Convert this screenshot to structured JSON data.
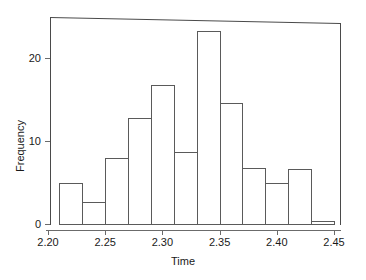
{
  "chart_data": {
    "type": "bar",
    "subtype": "histogram",
    "title": "",
    "xlabel": "Time",
    "ylabel": "Frequency",
    "xlim": [
      2.205,
      2.455
    ],
    "ylim": [
      0,
      24.5
    ],
    "xticks": [
      "2.20",
      "2.25",
      "2.30",
      "2.35",
      "2.40",
      "2.45"
    ],
    "xtick_values": [
      2.2,
      2.25,
      2.3,
      2.35,
      2.4,
      2.45
    ],
    "yticks": [
      "0",
      "10",
      "20"
    ],
    "ytick_values": [
      0,
      10,
      20
    ],
    "grid": false,
    "legend": null,
    "bin_width": 0.02,
    "bins": [
      {
        "x0": 2.21,
        "x1": 2.23,
        "value": 5
      },
      {
        "x0": 2.23,
        "x1": 2.25,
        "value": 2.7
      },
      {
        "x0": 2.25,
        "x1": 2.27,
        "value": 8
      },
      {
        "x0": 2.27,
        "x1": 2.29,
        "value": 12.8
      },
      {
        "x0": 2.29,
        "x1": 2.31,
        "value": 16.7
      },
      {
        "x0": 2.31,
        "x1": 2.33,
        "value": 8.7
      },
      {
        "x0": 2.33,
        "x1": 2.35,
        "value": 23.3
      },
      {
        "x0": 2.35,
        "x1": 2.37,
        "value": 14.6
      },
      {
        "x0": 2.37,
        "x1": 2.39,
        "value": 6.7
      },
      {
        "x0": 2.39,
        "x1": 2.41,
        "value": 4.9
      },
      {
        "x0": 2.41,
        "x1": 2.43,
        "value": 6.6
      },
      {
        "x0": 2.43,
        "x1": 2.45,
        "value": 0.4
      }
    ],
    "categories": [
      "2.21-2.23",
      "2.23-2.25",
      "2.25-2.27",
      "2.27-2.29",
      "2.29-2.31",
      "2.31-2.33",
      "2.33-2.35",
      "2.35-2.37",
      "2.37-2.39",
      "2.39-2.41",
      "2.41-2.43",
      "2.43-2.45"
    ],
    "values": [
      5,
      2.7,
      8,
      12.8,
      16.7,
      8.7,
      23.3,
      14.6,
      6.7,
      4.9,
      6.6,
      0.4
    ],
    "colors": {
      "bar_edge": "#5a5a5a",
      "bar_fill": "transparent",
      "axis": "#6b6b6b",
      "text": "#1a1a1a",
      "background": "#ffffff"
    }
  }
}
